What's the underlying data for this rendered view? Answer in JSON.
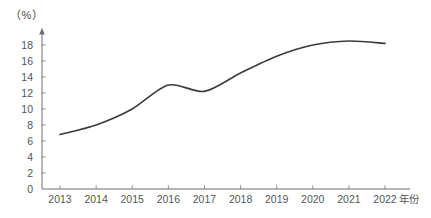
{
  "chart_data": {
    "type": "line",
    "title": "",
    "subtitle": "",
    "xlabel": "年份",
    "ylabel": "（%）",
    "ylim": [
      0,
      19.5
    ],
    "xlim": [
      2013,
      2022
    ],
    "grid": false,
    "legend": null,
    "legend_position": "none",
    "categories": [
      "2013",
      "2014",
      "2015",
      "2016",
      "2017",
      "2018",
      "2019",
      "2020",
      "2021",
      "2022"
    ],
    "x": [
      2013,
      2014,
      2015,
      2016,
      2017,
      2018,
      2019,
      2020,
      2021,
      2022
    ],
    "values": [
      6.8,
      8.0,
      10.0,
      13.0,
      12.2,
      14.5,
      16.6,
      18.0,
      18.5,
      18.2
    ],
    "series": [
      {
        "name": "",
        "values": [
          6.8,
          8.0,
          10.0,
          13.0,
          12.2,
          14.5,
          16.6,
          18.0,
          18.5,
          18.2
        ]
      }
    ],
    "y_ticks": [
      0,
      2,
      4,
      6,
      8,
      10,
      12,
      14,
      16,
      18
    ],
    "y_tick_labels": [
      "0",
      "2",
      "4",
      "6",
      "8",
      "10",
      "12",
      "14",
      "16",
      "18"
    ],
    "x_tick_labels": [
      "2013",
      "2014",
      "2015",
      "2016",
      "2017",
      "2018",
      "2019",
      "2020",
      "2021",
      "2022"
    ],
    "line_color": "#3a3a3a",
    "axis_color": "#6d6d6d",
    "text_color": "#555555",
    "background_color": "#ffffff",
    "smooth": true,
    "markers": false
  },
  "axis": {
    "unit_label": "（%）",
    "x_title": "年份"
  }
}
